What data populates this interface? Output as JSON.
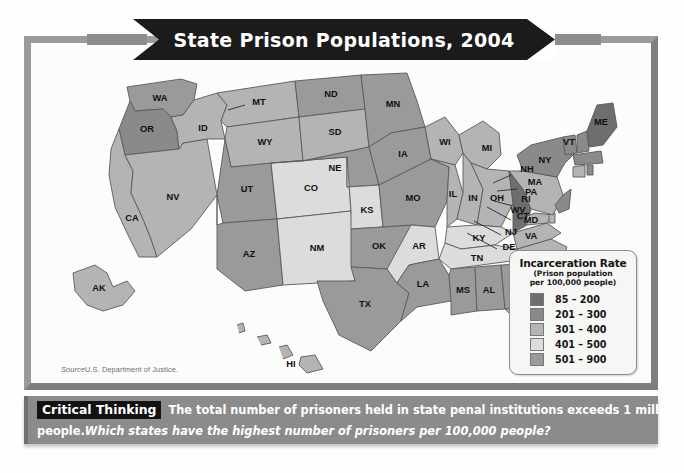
{
  "figure": {
    "title": "State Prison Populations, 2004",
    "source_prefix": "Source",
    "source_text": "U.S. Department of Justice."
  },
  "legend": {
    "title": "Incarceration Rate",
    "subtitle_line1": "(Prison population",
    "subtitle_line2": "per 100,000 people)",
    "items": [
      {
        "label": "85 – 200",
        "color": "#6e6e6e"
      },
      {
        "label": "201 – 300",
        "color": "#8a8a8a"
      },
      {
        "label": "301 – 400",
        "color": "#b4b4b4"
      },
      {
        "label": "401 – 500",
        "color": "#dcdcdc"
      },
      {
        "label": "501 – 900",
        "color": "#9a9a9a"
      }
    ]
  },
  "caption": {
    "badge": "Critical Thinking",
    "text_line1": "The total number of prisoners held in state penal institutions exceeds 1 million",
    "text_line2_plain": "people.",
    "text_line2_question": "Which states have the highest number of prisoners per 100,000 people?"
  },
  "chart_data": {
    "type": "map",
    "title": "State Prison Populations, 2004",
    "metric": "Incarceration Rate (Prison population per 100,000 people)",
    "source": "U.S. Department of Justice.",
    "legend_bins": [
      {
        "range": "85 – 200",
        "min": 85,
        "max": 200,
        "color": "#6e6e6e"
      },
      {
        "range": "201 – 300",
        "min": 201,
        "max": 300,
        "color": "#8a8a8a"
      },
      {
        "range": "301 – 400",
        "min": 301,
        "max": 400,
        "color": "#b4b4b4"
      },
      {
        "range": "401 – 500",
        "min": 401,
        "max": 500,
        "color": "#dcdcdc"
      },
      {
        "range": "501 – 900",
        "min": 501,
        "max": 900,
        "color": "#9a9a9a"
      }
    ],
    "states": [
      {
        "code": "WA",
        "bin": "501 – 900",
        "color": "#9a9a9a"
      },
      {
        "code": "OR",
        "bin": "201 – 300",
        "color": "#8a8a8a"
      },
      {
        "code": "CA",
        "bin": "301 – 400",
        "color": "#b4b4b4"
      },
      {
        "code": "NV",
        "bin": "301 – 400",
        "color": "#b4b4b4"
      },
      {
        "code": "ID",
        "bin": "301 – 400",
        "color": "#b4b4b4"
      },
      {
        "code": "MT",
        "bin": "301 – 400",
        "color": "#b4b4b4"
      },
      {
        "code": "WY",
        "bin": "301 – 400",
        "color": "#b4b4b4"
      },
      {
        "code": "UT",
        "bin": "501 – 900",
        "color": "#9a9a9a"
      },
      {
        "code": "CO",
        "bin": "401 – 500",
        "color": "#dcdcdc"
      },
      {
        "code": "AZ",
        "bin": "501 – 900",
        "color": "#9a9a9a"
      },
      {
        "code": "NM",
        "bin": "401 – 500",
        "color": "#dcdcdc"
      },
      {
        "code": "ND",
        "bin": "501 – 900",
        "color": "#9a9a9a"
      },
      {
        "code": "SD",
        "bin": "301 – 400",
        "color": "#b4b4b4"
      },
      {
        "code": "NE",
        "bin": "501 – 900",
        "color": "#9a9a9a"
      },
      {
        "code": "KS",
        "bin": "401 – 500",
        "color": "#dcdcdc"
      },
      {
        "code": "OK",
        "bin": "501 – 900",
        "color": "#9a9a9a"
      },
      {
        "code": "TX",
        "bin": "501 – 900",
        "color": "#9a9a9a"
      },
      {
        "code": "MN",
        "bin": "501 – 900",
        "color": "#9a9a9a"
      },
      {
        "code": "IA",
        "bin": "501 – 900",
        "color": "#9a9a9a"
      },
      {
        "code": "MO",
        "bin": "501 – 900",
        "color": "#9a9a9a"
      },
      {
        "code": "AR",
        "bin": "401 – 500",
        "color": "#dcdcdc"
      },
      {
        "code": "LA",
        "bin": "501 – 900",
        "color": "#9a9a9a"
      },
      {
        "code": "WI",
        "bin": "301 – 400",
        "color": "#b4b4b4"
      },
      {
        "code": "IL",
        "bin": "301 – 400",
        "color": "#b4b4b4"
      },
      {
        "code": "MI",
        "bin": "301 – 400",
        "color": "#b4b4b4"
      },
      {
        "code": "IN",
        "bin": "301 – 400",
        "color": "#b4b4b4"
      },
      {
        "code": "OH",
        "bin": "301 – 400",
        "color": "#b4b4b4"
      },
      {
        "code": "KY",
        "bin": "401 – 500",
        "color": "#dcdcdc"
      },
      {
        "code": "TN",
        "bin": "401 – 500",
        "color": "#dcdcdc"
      },
      {
        "code": "MS",
        "bin": "501 – 900",
        "color": "#9a9a9a"
      },
      {
        "code": "AL",
        "bin": "501 – 900",
        "color": "#9a9a9a"
      },
      {
        "code": "GA",
        "bin": "501 – 900",
        "color": "#9a9a9a"
      },
      {
        "code": "FL",
        "bin": "301 – 400",
        "color": "#b4b4b4"
      },
      {
        "code": "SC",
        "bin": "501 – 900",
        "color": "#9a9a9a"
      },
      {
        "code": "NC",
        "bin": "301 – 400",
        "color": "#b4b4b4"
      },
      {
        "code": "VA",
        "bin": "301 – 400",
        "color": "#b4b4b4"
      },
      {
        "code": "WV",
        "bin": "85 – 200",
        "color": "#6e6e6e"
      },
      {
        "code": "MD",
        "bin": "301 – 400",
        "color": "#b4b4b4"
      },
      {
        "code": "DE",
        "bin": "301 – 400",
        "color": "#b4b4b4"
      },
      {
        "code": "PA",
        "bin": "301 – 400",
        "color": "#b4b4b4"
      },
      {
        "code": "NJ",
        "bin": "201 – 300",
        "color": "#8a8a8a"
      },
      {
        "code": "NY",
        "bin": "201 – 300",
        "color": "#8a8a8a"
      },
      {
        "code": "CT",
        "bin": "301 – 400",
        "color": "#b4b4b4"
      },
      {
        "code": "RI",
        "bin": "201 – 300",
        "color": "#8a8a8a"
      },
      {
        "code": "MA",
        "bin": "201 – 300",
        "color": "#8a8a8a"
      },
      {
        "code": "VT",
        "bin": "201 – 300",
        "color": "#8a8a8a"
      },
      {
        "code": "NH",
        "bin": "201 – 300",
        "color": "#8a8a8a"
      },
      {
        "code": "ME",
        "bin": "85 – 200",
        "color": "#6e6e6e"
      },
      {
        "code": "AK",
        "bin": "301 – 400",
        "color": "#b4b4b4"
      },
      {
        "code": "HI",
        "bin": "301 – 400",
        "color": "#b4b4b4"
      }
    ],
    "labels_with_leader_lines": [
      "NH",
      "MA",
      "RI",
      "CT",
      "NJ",
      "DE"
    ]
  }
}
